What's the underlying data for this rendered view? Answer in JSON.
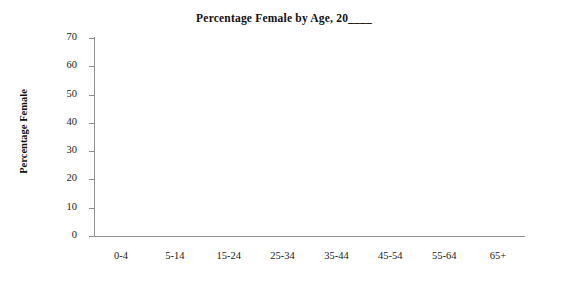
{
  "chart_data": {
    "type": "bar",
    "title": "Percentage Female by Age, 20____",
    "xlabel": "",
    "ylabel": "Percentage Female",
    "categories": [
      "0-4",
      "5-14",
      "15-24",
      "25-34",
      "35-44",
      "45-54",
      "55-64",
      "65+"
    ],
    "values": [
      null,
      null,
      null,
      null,
      null,
      null,
      null,
      null
    ],
    "series": [
      {
        "name": "Percentage Female",
        "values": [
          null,
          null,
          null,
          null,
          null,
          null,
          null,
          null
        ]
      }
    ],
    "yticks": [
      0,
      10,
      20,
      30,
      40,
      50,
      60,
      70
    ],
    "ytick_labels": [
      "0",
      "10",
      "20",
      "30",
      "40",
      "50",
      "60",
      "70"
    ],
    "ylim": [
      0,
      70
    ],
    "grid": false,
    "legend": false,
    "legend_position": "none",
    "plot_empty": true,
    "axis_color": "#8f8f8f",
    "text_color": "#1a1a1a",
    "background_color": "#ffffff",
    "annotations": []
  }
}
